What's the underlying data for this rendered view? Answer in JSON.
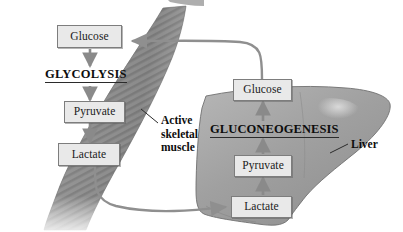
{
  "diagram": {
    "muscle": {
      "organ_label": "Active\nskeletal\nmuscle",
      "organ_label_lines": [
        "Active",
        "skeletal",
        "muscle"
      ],
      "pathway_label": "GLYCOLYSIS",
      "metabolites": [
        {
          "name": "Glucose",
          "label": "Glucose"
        },
        {
          "name": "Pyruvate",
          "label": "Pyruvate"
        },
        {
          "name": "Lactate",
          "label": "Lactate"
        }
      ]
    },
    "liver": {
      "organ_label": "Liver",
      "pathway_label": "GLUCONEOGENESIS",
      "metabolites": [
        {
          "name": "Glucose",
          "label": "Glucose"
        },
        {
          "name": "Pyruvate",
          "label": "Pyruvate"
        },
        {
          "name": "Lactate",
          "label": "Lactate"
        }
      ]
    },
    "transport_arrows": [
      {
        "name": "glucose-liver-to-muscle",
        "from": "liver Glucose",
        "to": "muscle Glucose"
      },
      {
        "name": "lactate-muscle-to-liver",
        "from": "muscle Lactate",
        "to": "liver Lactate"
      }
    ],
    "internal_arrows": [
      {
        "name": "muscle-glucose-to-pyruvate",
        "from": "Glucose",
        "to": "Pyruvate"
      },
      {
        "name": "muscle-pyruvate-to-lactate",
        "from": "Pyruvate",
        "to": "Lactate"
      },
      {
        "name": "liver-pyruvate-to-glucose",
        "from": "Pyruvate",
        "to": "Glucose"
      },
      {
        "name": "liver-lactate-to-pyruvate",
        "from": "Lactate",
        "to": "Pyruvate"
      }
    ]
  },
  "colors": {
    "background": "#ffffff",
    "box_fill": "#e9e9e9",
    "box_border": "#7d7d7d",
    "text": "#111111",
    "muscle_gray": "#8d8d8d",
    "liver_gray": "#a3a3a3",
    "vessel_gray": "#8f8f8f",
    "arrow_gray": "#8a8a8a"
  }
}
